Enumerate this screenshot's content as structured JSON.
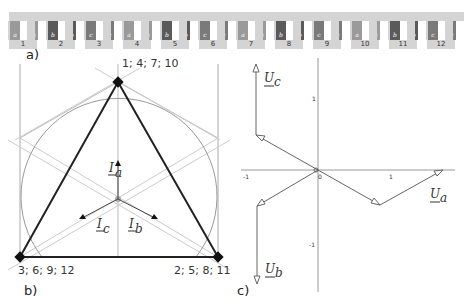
{
  "panel_a": {
    "label": "a)",
    "slot_groups": [
      {
        "number": "1",
        "slots": [
          "a",
          "-a"
        ],
        "shade": "#9a9a9a"
      },
      {
        "number": "2",
        "slots": [
          "b",
          "-b"
        ],
        "shade": "#5a5a5a"
      },
      {
        "number": "3",
        "slots": [
          "c",
          "-c"
        ],
        "shade": "#7a7a7a"
      },
      {
        "number": "4",
        "slots": [
          "a",
          "-a"
        ],
        "shade": "#9a9a9a"
      },
      {
        "number": "5",
        "slots": [
          "b",
          "-b"
        ],
        "shade": "#5a5a5a"
      },
      {
        "number": "6",
        "slots": [
          "c",
          "-c"
        ],
        "shade": "#7a7a7a"
      },
      {
        "number": "7",
        "slots": [
          "a",
          "-a"
        ],
        "shade": "#9a9a9a"
      },
      {
        "number": "8",
        "slots": [
          "b",
          "-b"
        ],
        "shade": "#5a5a5a"
      },
      {
        "number": "9",
        "slots": [
          "c",
          "-c"
        ],
        "shade": "#7a7a7a"
      },
      {
        "number": "10",
        "slots": [
          "a",
          "-a"
        ],
        "shade": "#9a9a9a"
      },
      {
        "number": "11",
        "slots": [
          "b",
          "-b"
        ],
        "shade": "#5a5a5a"
      },
      {
        "number": "12",
        "slots": [
          "c",
          "-c"
        ],
        "shade": "#7a7a7a"
      }
    ]
  },
  "panel_b": {
    "label": "b)",
    "vertex_top": "1; 4; 7; 10",
    "vertex_left": "3; 6; 9; 12",
    "vertex_right": "2; 5; 8; 11",
    "currents": {
      "a": "I",
      "a_sub": "a",
      "b": "I",
      "b_sub": "b",
      "c": "I",
      "c_sub": "c"
    }
  },
  "panel_c": {
    "label": "c)",
    "voltages": {
      "a": "U",
      "a_sub": "a",
      "b": "U",
      "b_sub": "b",
      "c": "U",
      "c_sub": "c"
    },
    "ticks": {
      "x_neg": "-1",
      "origin": "0",
      "x_pos": "1",
      "y_pos": "1",
      "y_neg": "-1"
    }
  }
}
